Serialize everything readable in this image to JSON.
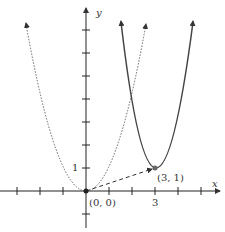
{
  "diagram": {
    "axes": {
      "x_label": "x",
      "y_label": "y",
      "x_tick_label": "3",
      "y_tick_label": "1"
    },
    "points": [
      {
        "label": "(0, 0)",
        "x": 0,
        "y": 0
      },
      {
        "label": "(3, 1)",
        "x": 3,
        "y": 1
      }
    ],
    "curves": [
      {
        "name": "y = x^2",
        "style": "dotted",
        "vertex": [
          0,
          0
        ]
      },
      {
        "name": "y = (x-3)^2 + 1",
        "style": "solid",
        "vertex": [
          3,
          1
        ]
      }
    ],
    "translation_vector": {
      "from": [
        0,
        0
      ],
      "to": [
        3,
        1
      ],
      "style": "dashed"
    },
    "colors": {
      "axis": "#222222",
      "curve": "#555555",
      "dotted": "#666666"
    }
  }
}
